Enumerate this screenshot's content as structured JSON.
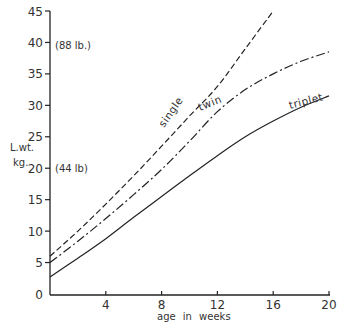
{
  "chart_data": {
    "type": "line",
    "title": "",
    "xlabel": "age in weeks",
    "ylabel": "L.wt. kg.",
    "ylabel_lines": [
      "L.wt.",
      "kg."
    ],
    "xlim": [
      0,
      20
    ],
    "ylim": [
      0,
      45
    ],
    "grid": false,
    "legend": "inline labels on curves",
    "x_ticks": [
      4,
      8,
      12,
      16,
      20
    ],
    "x_tick_labels": [
      "4",
      "8",
      "12",
      "16",
      "20"
    ],
    "y_ticks": [
      0,
      5,
      10,
      15,
      20,
      25,
      30,
      35,
      40,
      45
    ],
    "y_tick_labels": [
      "0",
      "5",
      "10",
      "15",
      "20",
      "25",
      "30",
      "35",
      "40",
      "45"
    ],
    "annotations": [
      {
        "y": 40,
        "text": "(88 lb.)"
      },
      {
        "y": 20,
        "text": "(44 lb)"
      }
    ],
    "series": [
      {
        "name": "single",
        "style": "dashed",
        "x": [
          0,
          2,
          4,
          6,
          8,
          10,
          12,
          14,
          16
        ],
        "values": [
          6,
          10,
          14.3,
          18.8,
          23.5,
          28.3,
          33,
          39,
          45
        ]
      },
      {
        "name": "twin",
        "style": "dash-dot",
        "x": [
          0,
          2,
          4,
          6,
          8,
          10,
          12,
          14,
          16,
          18,
          20
        ],
        "values": [
          5,
          8.4,
          12,
          15.8,
          19.8,
          24.3,
          29,
          32.5,
          35,
          37,
          38.5
        ]
      },
      {
        "name": "triplet",
        "style": "solid",
        "x": [
          0,
          2,
          4,
          6,
          8,
          10,
          12,
          14,
          16,
          18,
          20
        ],
        "values": [
          2.7,
          5.7,
          8.8,
          12.2,
          15.5,
          18.8,
          22,
          25,
          27.5,
          29.7,
          31.5
        ]
      }
    ]
  }
}
